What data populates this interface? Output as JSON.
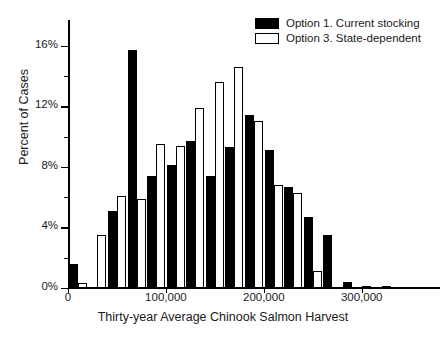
{
  "chart_data": {
    "type": "bar",
    "title": "",
    "xlabel": "Thirty-year Average Chinook Salmon Harvest",
    "ylabel": "Percent of Cases",
    "xlim": [
      0,
      380000
    ],
    "ylim": [
      0,
      17.7
    ],
    "grid": false,
    "legend_position": "top-right",
    "bin_width": 20000,
    "x_tick_labels": [
      "0",
      "100,000",
      "200,000",
      "300,000"
    ],
    "x_tick_values": [
      0,
      100000,
      200000,
      300000
    ],
    "y_tick_labels": [
      "0%",
      "4%",
      "8%",
      "12%",
      "16%"
    ],
    "y_tick_values": [
      0,
      4,
      8,
      12,
      16
    ],
    "y_minor_tick_values": [
      2,
      6,
      10,
      14
    ],
    "bin_centers": [
      10000,
      30000,
      50000,
      70000,
      90000,
      110000,
      130000,
      150000,
      170000,
      190000,
      210000,
      230000,
      250000,
      270000,
      290000,
      310000,
      330000,
      350000,
      370000
    ],
    "series": [
      {
        "name": "Option 1. Current stocking",
        "color": "#000000",
        "fill": "solid",
        "values": [
          1.6,
          0.0,
          5.1,
          15.7,
          7.4,
          8.1,
          9.7,
          7.4,
          9.3,
          11.4,
          9.1,
          6.7,
          4.7,
          3.5,
          0.4,
          0.15,
          0.05,
          0.0,
          0.0
        ]
      },
      {
        "name": "Option 3. State-dependent",
        "color": "#ffffff",
        "fill": "open",
        "values": [
          0.3,
          3.5,
          6.1,
          5.9,
          9.5,
          9.4,
          11.9,
          13.6,
          14.6,
          11.0,
          6.8,
          6.3,
          1.1,
          0.0,
          0.0,
          0.0,
          0.0,
          0.0,
          0.0
        ]
      }
    ]
  },
  "legend": {
    "items": [
      {
        "label": "Option 1. Current stocking",
        "swatch": "filled-black-square"
      },
      {
        "label": "Option 3. State-dependent",
        "swatch": "open-white-square"
      }
    ]
  },
  "axes": {
    "y_title": "Percent of Cases",
    "x_title": "Thirty-year Average Chinook Salmon Harvest"
  }
}
